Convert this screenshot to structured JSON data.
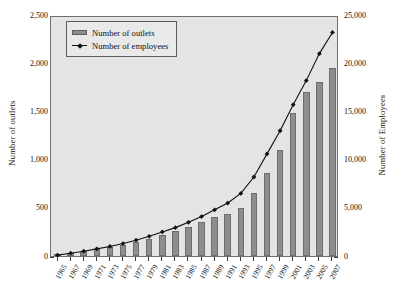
{
  "chart_data": {
    "type": "bar",
    "title": "",
    "xlabel": "",
    "ylabel": "Number of outlets",
    "y2label": "Number of Employees",
    "grid": false,
    "legend_position": "top-left",
    "categories": [
      "1965",
      "1967",
      "1969",
      "1971",
      "1973",
      "1975",
      "1977",
      "1979",
      "1981",
      "1983",
      "1985",
      "1987",
      "1989",
      "1991",
      "1993",
      "1995",
      "1997",
      "1999",
      "2001",
      "2003",
      "2005",
      "2007"
    ],
    "ylim": [
      0,
      2500
    ],
    "y2lim": [
      0,
      25000
    ],
    "yticks": [
      "0",
      "500",
      "1,000",
      "1,500",
      "2,000",
      "2,500"
    ],
    "y2ticks": [
      "0",
      "5,000",
      "10,000",
      "15,000",
      "20,000",
      "25,000"
    ],
    "series": [
      {
        "name": "Number of outlets",
        "type": "bar",
        "axis": "left",
        "color": "#8d8d8d",
        "values": [
          20,
          35,
          50,
          70,
          90,
          115,
          145,
          180,
          215,
          255,
          300,
          350,
          400,
          440,
          500,
          650,
          860,
          1100,
          1480,
          1700,
          1800,
          1950
        ]
      },
      {
        "name": "Number of employees",
        "type": "line",
        "axis": "right",
        "color": "#111111",
        "values": [
          300,
          500,
          700,
          950,
          1200,
          1500,
          1850,
          2250,
          2700,
          3150,
          3700,
          4300,
          5000,
          5700,
          6700,
          8400,
          10800,
          13200,
          15900,
          18400,
          21200,
          23400
        ]
      }
    ]
  },
  "legend": {
    "items": [
      {
        "label": "Number of outlets",
        "marker": "bar-swatch"
      },
      {
        "label": "Number of employees",
        "marker": "line-marker"
      }
    ]
  },
  "colors": {
    "bar": "#8d8d8d",
    "line": "#111111",
    "plot_background": "#e4e4e4",
    "frame": "#6f6f6f",
    "page_background": "#ffffff"
  }
}
